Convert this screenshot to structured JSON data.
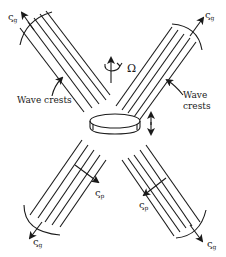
{
  "diagram": {
    "type": "internal-wave-st-andrews-cross",
    "labels": {
      "omega": "Ω",
      "wave_crests_left": "Wave crests",
      "wave_crests_right_line1": "Wave",
      "wave_crests_right_line2": "crests",
      "group_velocity_symbol": "ς",
      "group_velocity_subscript": "g",
      "phase_velocity_symbol": "ς",
      "phase_velocity_subscript": "p"
    },
    "beams": [
      {
        "name": "upper-left",
        "label": "ς",
        "subscript": "g"
      },
      {
        "name": "upper-right",
        "label": "ς",
        "subscript": "g"
      },
      {
        "name": "lower-left",
        "label": "ς",
        "subscript": "g",
        "phase_label": "ς",
        "phase_subscript": "p"
      },
      {
        "name": "lower-right",
        "label": "ς",
        "subscript": "g",
        "phase_label": "ς",
        "phase_subscript": "p"
      }
    ],
    "colors": {
      "ink": "#1a1a1a",
      "background": "#ffffff"
    }
  }
}
